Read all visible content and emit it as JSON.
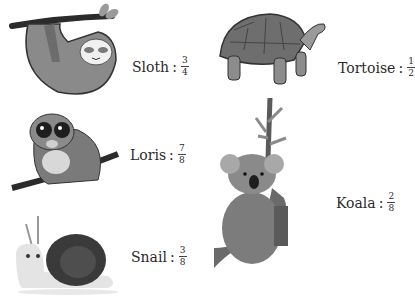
{
  "items": [
    {
      "animal": "Sloth",
      "separator": ":",
      "numerator": "3",
      "denominator": "4",
      "icon": "sloth-illustration"
    },
    {
      "animal": "Tortoise",
      "separator": ":",
      "numerator": "1",
      "denominator": "2",
      "icon": "tortoise-illustration"
    },
    {
      "animal": "Loris",
      "separator": ":",
      "numerator": "7",
      "denominator": "8",
      "icon": "loris-illustration"
    },
    {
      "animal": "Koala",
      "separator": ":",
      "numerator": "2",
      "denominator": "8",
      "icon": "koala-illustration"
    },
    {
      "animal": "Snail",
      "separator": ":",
      "numerator": "3",
      "denominator": "8",
      "icon": "snail-illustration"
    }
  ]
}
